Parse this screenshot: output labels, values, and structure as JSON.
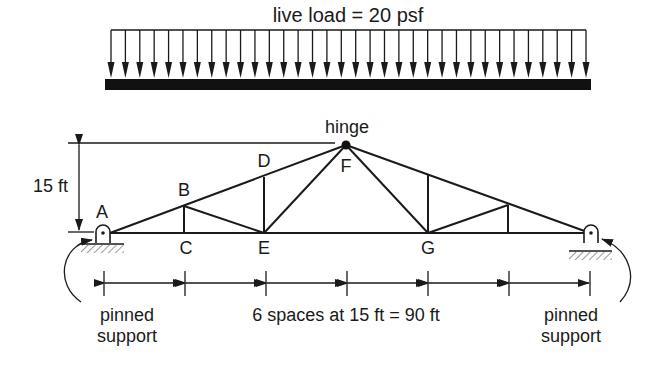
{
  "load": {
    "label": "live load = 20 psf",
    "arrow_count": 34
  },
  "dimension_height": {
    "label": "15 ft"
  },
  "dimension_span": {
    "label": "6 spaces at 15 ft = 90 ft",
    "spaces": 6
  },
  "hinge": {
    "label": "hinge"
  },
  "nodes": {
    "A": "A",
    "B": "B",
    "C": "C",
    "D": "D",
    "E": "E",
    "F": "F",
    "G": "G"
  },
  "supports": {
    "left": {
      "line1": "pinned",
      "line2": "support"
    },
    "right": {
      "line1": "pinned",
      "line2": "support"
    }
  },
  "colors": {
    "ink": "#1a1a1a",
    "background": "#ffffff"
  }
}
